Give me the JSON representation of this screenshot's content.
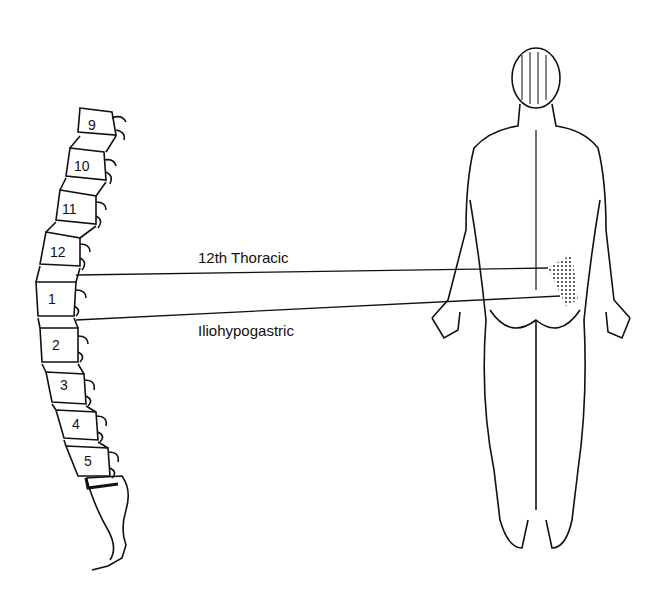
{
  "figure": {
    "labels": {
      "upper_line": "12th Thoracic",
      "lower_line": "Iliohypogastric"
    },
    "vertebrae": {
      "thoracic": [
        "9",
        "10",
        "11",
        "12"
      ],
      "lumbar": [
        "1",
        "2",
        "3",
        "4",
        "5"
      ]
    },
    "colors": {
      "ink": "#111111",
      "background": "#ffffff"
    }
  }
}
